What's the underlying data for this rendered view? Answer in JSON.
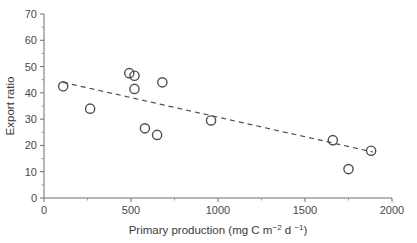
{
  "chart_data": {
    "type": "scatter",
    "title": "",
    "xlabel": "Primary production (mg C m-2 d -1)",
    "xlabel_parts": {
      "main": "Primary production (mg C m",
      "sup1": "−2",
      "mid": " d ",
      "sup2": "−1",
      "tail": ")"
    },
    "ylabel": "Export ratio",
    "xlim": [
      0,
      2000
    ],
    "ylim": [
      0,
      70
    ],
    "xticks": [
      0,
      500,
      1000,
      1500,
      2000
    ],
    "yticks": [
      0,
      10,
      20,
      30,
      40,
      50,
      60,
      70
    ],
    "xtick_labels": [
      "0",
      "500",
      "1000",
      "1500",
      "2000"
    ],
    "ytick_labels": [
      "0",
      "10",
      "20",
      "30",
      "40",
      "50",
      "60",
      "70"
    ],
    "x_minor_ticks": [
      250,
      750,
      1250,
      1750
    ],
    "y_minor_ticks": [
      5,
      15,
      25,
      35,
      45,
      55,
      65
    ],
    "grid": false,
    "legend": false,
    "marker_style": "open-circle",
    "marker_color": "#4d4d55",
    "points": [
      {
        "x": 110,
        "y": 42.5
      },
      {
        "x": 265,
        "y": 34.0
      },
      {
        "x": 490,
        "y": 47.5
      },
      {
        "x": 520,
        "y": 46.5
      },
      {
        "x": 520,
        "y": 41.5
      },
      {
        "x": 580,
        "y": 26.5
      },
      {
        "x": 650,
        "y": 24.0
      },
      {
        "x": 680,
        "y": 44.0
      },
      {
        "x": 960,
        "y": 29.5
      },
      {
        "x": 1660,
        "y": 22.0
      },
      {
        "x": 1750,
        "y": 11.0
      },
      {
        "x": 1880,
        "y": 18.0
      }
    ],
    "trendline": {
      "style": "dashed",
      "color": "#4d4d55",
      "x_start": 110,
      "y_start": 44.0,
      "x_end": 1890,
      "y_end": 17.5
    }
  }
}
